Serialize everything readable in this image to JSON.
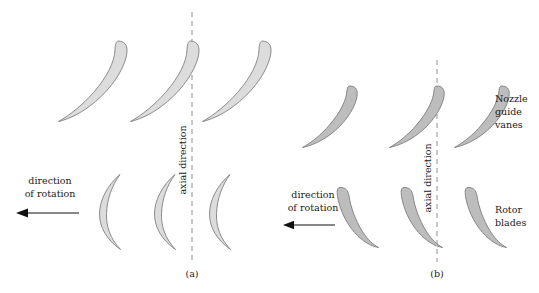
{
  "figure": {
    "background_color": "#ffffff",
    "panels": [
      {
        "id": "a",
        "panel_label": "(a)",
        "rotation_label_line1": "direction",
        "rotation_label_line2": "of rotation",
        "axial_label": "axial direction",
        "blade_fill": "#dcdcdc",
        "blade_stroke": "#808080",
        "rows": [
          {
            "name": "nozzle-guide-vanes",
            "blade_count": 3,
            "side_label_lines": []
          },
          {
            "name": "rotor-blades",
            "blade_count": 3,
            "side_label_lines": []
          }
        ]
      },
      {
        "id": "b",
        "panel_label": "(b)",
        "rotation_label_line1": "direction",
        "rotation_label_line2": "of rotation",
        "axial_label": "axial direction",
        "blade_fill": "#bdbdbd",
        "blade_stroke": "#7d7d7d",
        "rows": [
          {
            "name": "nozzle-guide-vanes",
            "blade_count": 3,
            "side_label_lines": [
              "Nozzle",
              "guide",
              "vanes"
            ]
          },
          {
            "name": "rotor-blades",
            "blade_count": 3,
            "side_label_lines": [
              "Rotor",
              "blades"
            ]
          }
        ]
      }
    ],
    "axis_line_color": "#9a9a9a",
    "arrow_color": "#111111",
    "caption": ""
  }
}
